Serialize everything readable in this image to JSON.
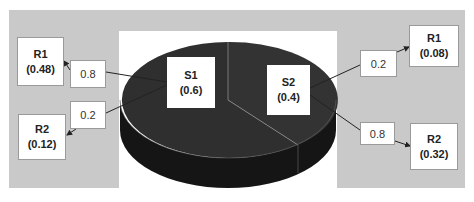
{
  "diagram": {
    "type": "probability-tree-over-3d-pie",
    "colors": {
      "background_gray": "#c9c9c9",
      "panel": "#ffffff",
      "pie_top": "#2e2e2e",
      "pie_side": "#141414",
      "slice_divider": "#8a8a8a",
      "box_fill": "#ffffff",
      "box_border": "#9a9a9a"
    },
    "slices": [
      {
        "id": "S1",
        "label": "S1",
        "value": "(0.6)",
        "share": 0.6
      },
      {
        "id": "S2",
        "label": "S2",
        "value": "(0.4)",
        "share": 0.4
      }
    ],
    "branches": {
      "s1_r1": {
        "prob": "0.8",
        "result_label": "R1",
        "result_value": "(0.48)"
      },
      "s1_r2": {
        "prob": "0.2",
        "result_label": "R2",
        "result_value": "(0.12)"
      },
      "s2_r1": {
        "prob": "0.2",
        "result_label": "R1",
        "result_value": "(0.08)"
      },
      "s2_r2": {
        "prob": "0.8",
        "result_label": "R2",
        "result_value": "(0.32)"
      }
    }
  }
}
